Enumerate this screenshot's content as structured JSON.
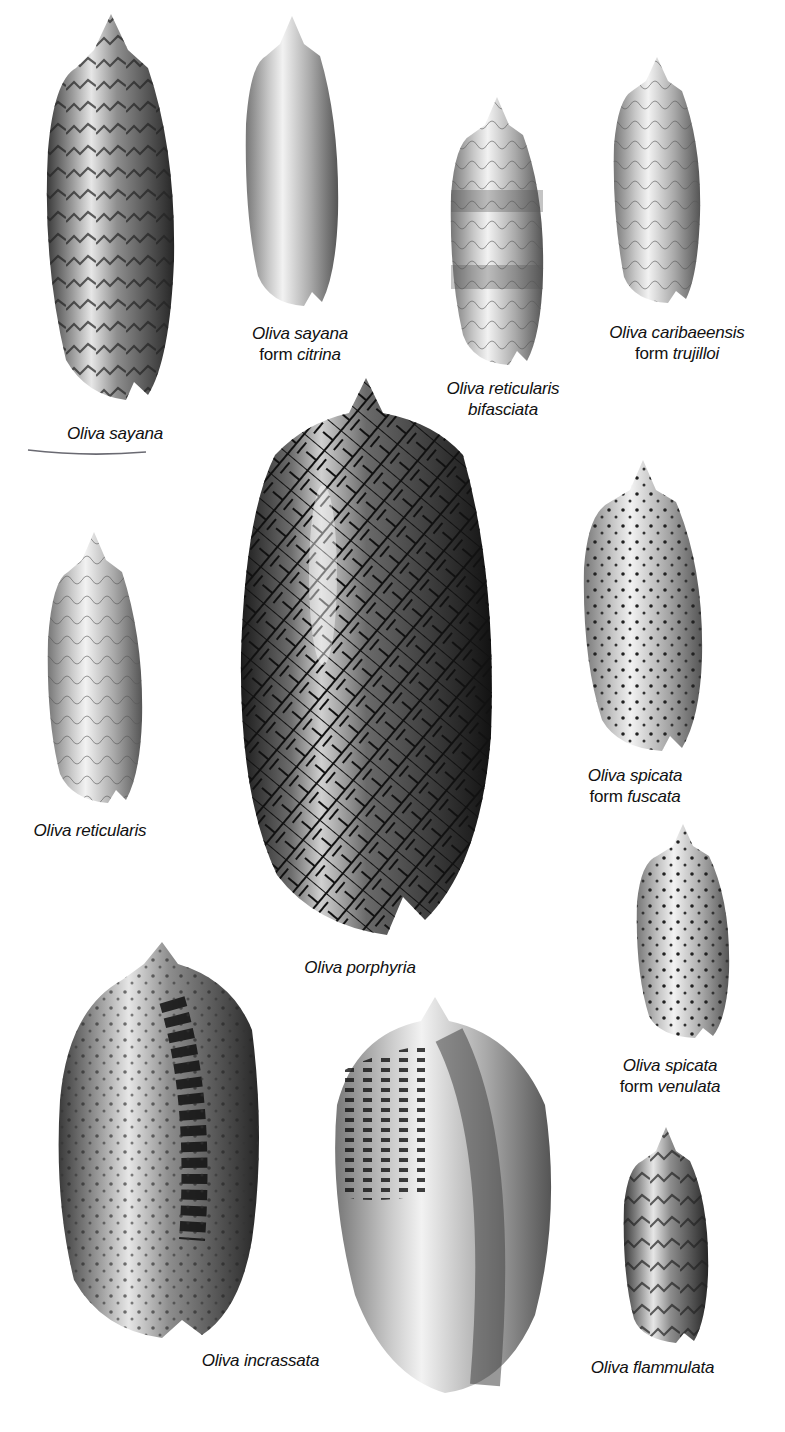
{
  "plate": {
    "background": "#ffffff",
    "ink_color": "#111111",
    "annotation_color": "#6a6a72"
  },
  "specimens": [
    {
      "id": "sayana",
      "name": "Oliva sayana",
      "form_prefix": "",
      "form": "",
      "annotated_underline": true
    },
    {
      "id": "sayana-citrina",
      "name": "Oliva sayana",
      "form_prefix": "form",
      "form": "citrina"
    },
    {
      "id": "reticularis-bifasciata",
      "name": "Oliva reticularis",
      "form_prefix": "",
      "form": "bifasciata"
    },
    {
      "id": "caribaeensis-trujilloi",
      "name": "Oliva caribaeensis",
      "form_prefix": "form",
      "form": "trujilloi"
    },
    {
      "id": "reticularis",
      "name": "Oliva reticularis",
      "form_prefix": "",
      "form": ""
    },
    {
      "id": "porphyria",
      "name": "Oliva porphyria",
      "form_prefix": "",
      "form": ""
    },
    {
      "id": "spicata-fuscata",
      "name": "Oliva spicata",
      "form_prefix": "form",
      "form": "fuscata"
    },
    {
      "id": "spicata-venulata",
      "name": "Oliva spicata",
      "form_prefix": "form",
      "form": "venulata"
    },
    {
      "id": "incrassata",
      "name": "Oliva incrassata",
      "form_prefix": "",
      "form": ""
    },
    {
      "id": "flammulata",
      "name": "Oliva flammulata",
      "form_prefix": "",
      "form": ""
    }
  ]
}
